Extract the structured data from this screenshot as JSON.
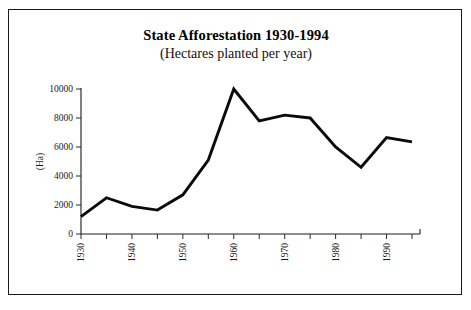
{
  "chart_data": {
    "type": "line",
    "title": "State Afforestation 1930-1994",
    "subtitle": "(Hectares planted per year)",
    "xlabel": "",
    "ylabel": "(Ha)",
    "xlim": [
      1930,
      1995
    ],
    "ylim": [
      0,
      10000
    ],
    "grid": false,
    "legend": "none",
    "y_ticks": [
      0,
      2000,
      4000,
      6000,
      8000,
      10000
    ],
    "y_tick_labels": [
      "0",
      "2000",
      "4000",
      "6000",
      "8000",
      "10000"
    ],
    "x_ticks": [
      1930,
      1935,
      1940,
      1945,
      1950,
      1955,
      1960,
      1965,
      1970,
      1975,
      1980,
      1985,
      1990,
      1995
    ],
    "x_tick_labels_shown": [
      "1930",
      "1940",
      "1950",
      "1960",
      "1970",
      "1980",
      "1990"
    ],
    "x_tick_label_rotation": 90,
    "x": [
      1930,
      1935,
      1940,
      1945,
      1950,
      1955,
      1960,
      1965,
      1970,
      1975,
      1980,
      1985,
      1990,
      1995
    ],
    "values": [
      1200,
      2500,
      1900,
      1650,
      2700,
      5100,
      10000,
      7800,
      8200,
      8000,
      6000,
      4600,
      6650,
      6350
    ],
    "series": [
      {
        "name": "Hectares planted per year",
        "color": "#0a0a0a",
        "values": [
          1200,
          2500,
          1900,
          1650,
          2700,
          5100,
          10000,
          7800,
          8200,
          8000,
          6000,
          4600,
          6650,
          6350
        ]
      }
    ]
  },
  "figure": {
    "border_color": "#1a1a1a",
    "background": "#ffffff",
    "axis_color": "#1c1c1c"
  }
}
